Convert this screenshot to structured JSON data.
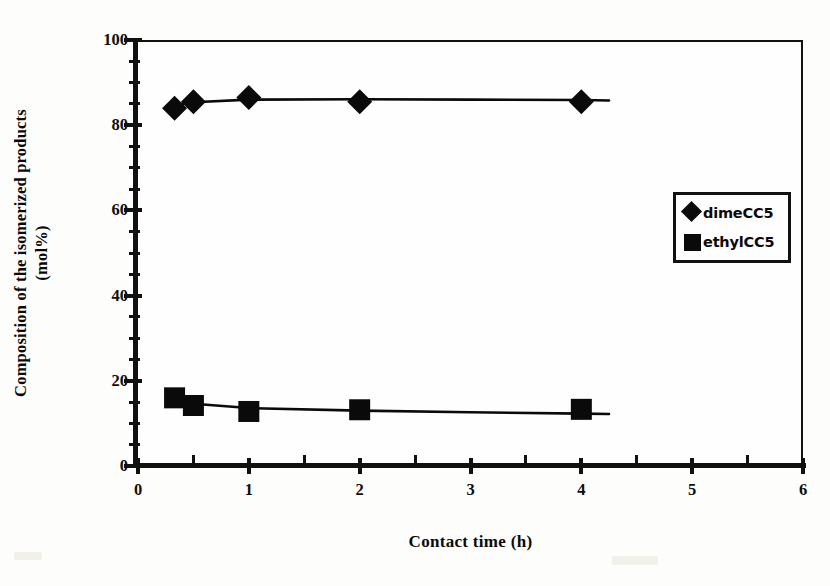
{
  "chart_data": {
    "type": "scatter",
    "title": "",
    "xlabel": "Contact time (h)",
    "ylabel": "Composition of the isomerized products (mol%)",
    "ylabel_line1": "Composition of the isomerized products",
    "ylabel_line2": "(mol%)",
    "xlim": [
      0,
      6
    ],
    "ylim": [
      0,
      100
    ],
    "x_major_ticks": [
      0,
      1,
      2,
      3,
      4,
      5,
      6
    ],
    "x_tick_labels": [
      "0",
      "1",
      "2",
      "3",
      "4",
      "5",
      "6"
    ],
    "x_minor_step": 0.5,
    "y_major_ticks": [
      0,
      20,
      40,
      60,
      80,
      100
    ],
    "y_tick_labels": [
      "0",
      "20",
      "40",
      "60",
      "80",
      "100"
    ],
    "y_minor_step": 5,
    "grid": false,
    "legend_position": "upper-right",
    "series": [
      {
        "name": "dimeCC5",
        "marker": "diamond",
        "color": "#0a0a0a",
        "x": [
          0.33,
          0.5,
          1.0,
          2.0,
          4.0
        ],
        "values": [
          84.0,
          85.5,
          86.5,
          85.5,
          85.5
        ],
        "fit_line": {
          "x": [
            0.3,
            0.5,
            1.0,
            2.0,
            3.0,
            4.0,
            4.25
          ],
          "y": [
            84.6,
            85.4,
            86.0,
            86.1,
            86.0,
            85.9,
            85.8
          ]
        }
      },
      {
        "name": "ethylCC5",
        "marker": "square",
        "color": "#0a0a0a",
        "x": [
          0.33,
          0.5,
          1.0,
          2.0,
          4.0
        ],
        "values": [
          16.0,
          14.2,
          12.8,
          13.2,
          13.3
        ],
        "fit_line": {
          "x": [
            0.3,
            0.5,
            1.0,
            2.0,
            3.0,
            4.0,
            4.25
          ],
          "y": [
            15.6,
            14.6,
            13.6,
            13.0,
            12.6,
            12.3,
            12.2
          ]
        }
      }
    ]
  },
  "legend": {
    "items": [
      {
        "label": "dimeCC5",
        "marker": "diamond-icon"
      },
      {
        "label": "ethylCC5",
        "marker": "square-icon"
      }
    ]
  }
}
